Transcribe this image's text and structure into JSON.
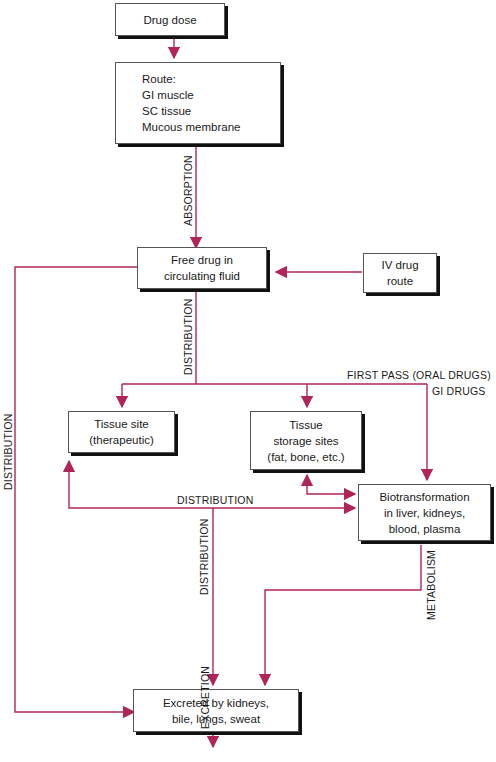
{
  "diagram": {
    "type": "flowchart",
    "topic": "Drug pharmacokinetics pathway",
    "line_color": "#b0245a",
    "nodes": {
      "drug_dose": {
        "lines": [
          "Drug dose"
        ]
      },
      "route": {
        "lines": [
          "Route:",
          "GI muscle",
          "SC tissue",
          "Mucous membrane"
        ]
      },
      "free_drug": {
        "lines": [
          "Free drug in",
          "circulating fluid"
        ]
      },
      "iv_route": {
        "lines": [
          "IV drug",
          "route"
        ]
      },
      "tissue_site": {
        "lines": [
          "Tissue site",
          "(therapeutic)"
        ]
      },
      "tissue_storage": {
        "lines": [
          "Tissue",
          "storage sites",
          "(fat, bone, etc.)"
        ]
      },
      "biotransformation": {
        "lines": [
          "Biotransformation",
          "in liver, kidneys,",
          "blood, plasma"
        ]
      },
      "excreted": {
        "lines": [
          "Excreted by kidneys,",
          "bile, lungs, sweat"
        ]
      }
    },
    "edge_labels": {
      "absorption": "ABSORPTION",
      "distribution_main": "DISTRIBUTION",
      "distribution_left": "DISTRIBUTION",
      "distribution_horizontal": "DISTRIBUTION",
      "distribution_lower": "DISTRIBUTION",
      "first_pass": "FIRST PASS (ORAL DRUGS)",
      "gi_drugs": "GI DRUGS",
      "metabolism": "METABOLISM",
      "excretion": "EXCRETION"
    },
    "edges": [
      {
        "from": "drug_dose",
        "to": "route"
      },
      {
        "from": "route",
        "to": "free_drug",
        "label": "ABSORPTION"
      },
      {
        "from": "iv_route",
        "to": "free_drug"
      },
      {
        "from": "free_drug",
        "to": "tissue_site",
        "label": "DISTRIBUTION"
      },
      {
        "from": "free_drug",
        "to": "tissue_storage",
        "label": "DISTRIBUTION"
      },
      {
        "from": "free_drug",
        "to": "biotransformation",
        "label": "FIRST PASS (ORAL DRUGS) / GI DRUGS"
      },
      {
        "from": "free_drug",
        "to": "excreted",
        "label": "DISTRIBUTION"
      },
      {
        "from": "tissue_site",
        "to": "biotransformation",
        "label": "DISTRIBUTION",
        "bidirectional": true
      },
      {
        "from": "tissue_storage",
        "to": "biotransformation",
        "bidirectional": true
      },
      {
        "from": "tissue_site",
        "to": "excreted",
        "label": "DISTRIBUTION"
      },
      {
        "from": "biotransformation",
        "to": "excreted",
        "label": "METABOLISM"
      },
      {
        "from": "excreted",
        "to": "out",
        "label": "EXCRETION"
      }
    ]
  }
}
